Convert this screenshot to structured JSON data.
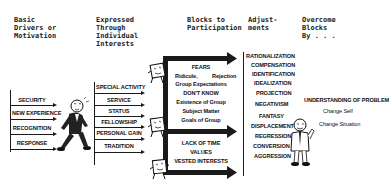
{
  "headers": {
    "col1": "Basic\nDrivers or\nMotivation",
    "col2": "Expressed\nThrough\nIndividual\nInterests",
    "col3": "Blocks to\nParticipation",
    "col4": "Adjust-\nments",
    "col5": "Overcome\nBlocks\nBy . . ."
  },
  "drivers": [
    "SECURITY",
    "NEW EXPERIENCE",
    "RECOGNITION",
    "RESPONSE"
  ],
  "interests": [
    "SPECIAL ACTIVITY",
    "SERVICE",
    "STATUS",
    "FELLOWSHIP",
    "PERSONAL GAIN",
    "TRADITION"
  ],
  "blocks": {
    "fears_title": "FEARS",
    "fears_left": "Ridicule,",
    "fears_right": "Rejection",
    "group_expectations": "Group Expectations",
    "dont_know_title": "DON'T KNOW",
    "dont_know_items": [
      "Existence of Group",
      "Subject Matter",
      "Goals of Group"
    ],
    "other_items": [
      "LACK OF TIME",
      "VALUES",
      "VESTED INTERESTS"
    ]
  },
  "adjustments": [
    "RATIONALIZATION",
    "COMPENSATION",
    "IDENTIFICATION",
    "IDEALIZATION",
    "PROJECTION",
    "NEGATIVISM",
    "FANTASY",
    "DISPLACEMENT",
    "REGRESSION",
    "CONVERSION",
    "AGGRESSION"
  ],
  "overcome": {
    "main": "UNDERSTANDING OF PROBLEM",
    "items": [
      "Change Self",
      "Change Situation"
    ]
  },
  "figures": {
    "walking_man": "walking-man-cartoon",
    "block_creatures": "block-creature-cartoon",
    "standing_man": "standing-man-cartoon"
  }
}
